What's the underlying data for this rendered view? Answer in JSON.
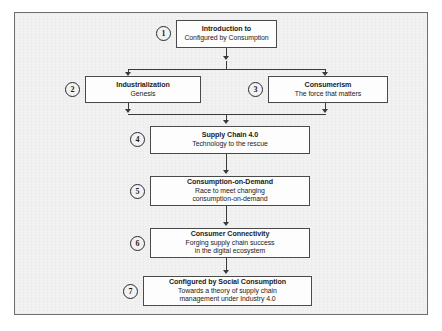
{
  "figure": {
    "frame_color": "#6e6e6e",
    "background_color": "#f2f2f2",
    "box_border_color": "#4a4a4a",
    "box_fill_color": "#fdfdfd",
    "connector_color": "#3a3a3a"
  },
  "nodes": [
    {
      "number": "1",
      "title": "Introduction to",
      "subtitle_lines": [
        "Configured by Consumption"
      ]
    },
    {
      "number": "2",
      "title": "Industrialization",
      "subtitle_lines": [
        "Genesis"
      ]
    },
    {
      "number": "3",
      "title": "Consumerism",
      "subtitle_lines": [
        "The force that matters"
      ]
    },
    {
      "number": "4",
      "title": "Supply Chain 4.0",
      "subtitle_lines": [
        "Technology to the rescue"
      ]
    },
    {
      "number": "5",
      "title": "Consumption-on-Demand",
      "subtitle_lines": [
        "Race to meet changing",
        "consumption-on-demand"
      ]
    },
    {
      "number": "6",
      "title": "Consumer Connectivity",
      "subtitle_lines": [
        "Forging supply chain success",
        "in the digital ecosystem"
      ]
    },
    {
      "number": "7",
      "title": "Configured by Social Consumption",
      "subtitle_lines": [
        "Towards a theory of supply chain",
        "management under Industry 4.0"
      ]
    }
  ]
}
